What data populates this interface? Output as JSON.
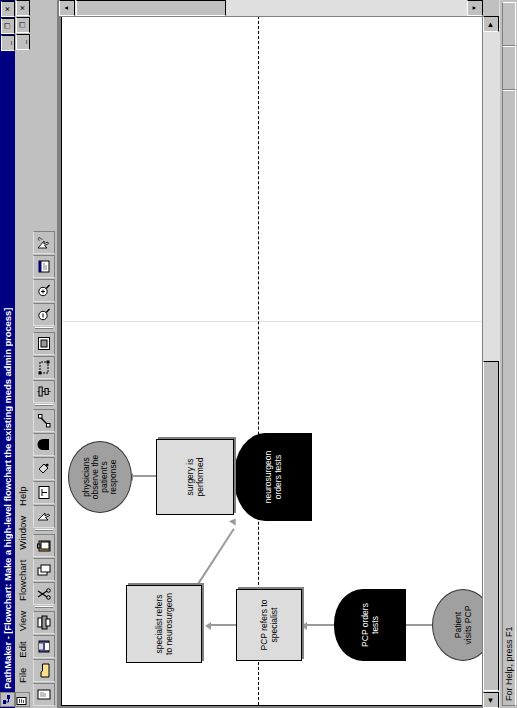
{
  "window": {
    "title": "PathMaker - [Flowchart: Make a high-level flowchart the existing meds admin process]",
    "app_icon": "pathmaker-icon",
    "minimize_label": "_",
    "restore_label": "❐",
    "close_label": "✕",
    "child_minimize_label": "_",
    "child_restore_label": "❐",
    "child_close_label": "✕",
    "mdi_icon": "document-icon"
  },
  "menu": {
    "items": [
      {
        "label": "File"
      },
      {
        "label": "Edit"
      },
      {
        "label": "View"
      },
      {
        "label": "Flowchart"
      },
      {
        "label": "Window"
      },
      {
        "label": "Help"
      }
    ]
  },
  "toolbar": {
    "buttons": [
      {
        "name": "new-button",
        "icon": "new-document-icon"
      },
      {
        "name": "open-button",
        "icon": "open-folder-icon"
      },
      {
        "name": "save-button",
        "icon": "save-disk-icon"
      },
      {
        "name": "print-button",
        "icon": "printer-icon"
      },
      {
        "name": "cut-button",
        "icon": "scissors-icon"
      },
      {
        "name": "copy-button",
        "icon": "copy-icon"
      },
      {
        "name": "paste-button",
        "icon": "paste-clipboard-icon"
      },
      {
        "name": "select-tool",
        "icon": "arrow-pointer-icon"
      },
      {
        "name": "text-tool",
        "icon": "text-tool-icon"
      },
      {
        "name": "fill-color-button",
        "icon": "paint-bucket-icon"
      },
      {
        "name": "shape-dshape",
        "icon": "d-shape-icon"
      },
      {
        "name": "connector-tool",
        "icon": "connector-line-icon"
      },
      {
        "name": "align-button",
        "icon": "align-icon"
      },
      {
        "name": "group-button",
        "icon": "group-icon"
      },
      {
        "name": "frame-button",
        "icon": "frame-icon"
      },
      {
        "name": "zoom-out-button",
        "icon": "zoom-out-icon"
      },
      {
        "name": "zoom-in-button",
        "icon": "zoom-in-icon"
      },
      {
        "name": "properties-button",
        "icon": "properties-icon"
      },
      {
        "name": "help-pointer-button",
        "icon": "help-arrow-icon"
      }
    ]
  },
  "flowchart": {
    "nodes": [
      {
        "id": "start",
        "shape": "ellipse",
        "label": "Patient\nvisits PCP"
      },
      {
        "id": "pcp-tests",
        "shape": "d-shape",
        "label": "PCP orders\ntests"
      },
      {
        "id": "pcp-refers",
        "shape": "process",
        "label": "PCP refers to\nspecialist"
      },
      {
        "id": "spec-refers",
        "shape": "process",
        "label": "specialist refers\nto neurosurgeon"
      },
      {
        "id": "neuro-tests",
        "shape": "d-shape",
        "label": "neurosurgeon\norders tests"
      },
      {
        "id": "surgery",
        "shape": "process",
        "label": "surgery is\nperformed"
      },
      {
        "id": "observe",
        "shape": "ellipse",
        "label": "physicians\nobserve the\npatient's\nresponse"
      }
    ]
  },
  "statusbar": {
    "help_text": "For Help, press F1",
    "pane2": "",
    "pane3": ""
  }
}
